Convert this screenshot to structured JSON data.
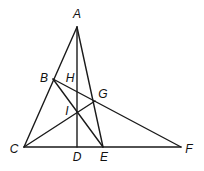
{
  "diagram": {
    "points": {
      "A": {
        "label": "A",
        "x": 77,
        "y": 27,
        "lx": 77,
        "ly": 15
      },
      "B": {
        "label": "B",
        "x": 53,
        "y": 79,
        "lx": 44,
        "ly": 79
      },
      "H": {
        "label": "H",
        "lx": 70,
        "ly": 79
      },
      "G": {
        "label": "G",
        "x": 95,
        "y": 101,
        "lx": 103,
        "ly": 95
      },
      "I": {
        "label": "I",
        "x": 78,
        "y": 112,
        "lx": 67,
        "ly": 112
      },
      "C": {
        "label": "C",
        "x": 24,
        "y": 147,
        "lx": 14,
        "ly": 150
      },
      "D": {
        "label": "D",
        "x": 77,
        "y": 147,
        "lx": 77,
        "ly": 158
      },
      "E": {
        "label": "E",
        "x": 103,
        "y": 147,
        "lx": 104,
        "ly": 158
      },
      "F": {
        "label": "F",
        "x": 181,
        "y": 147,
        "lx": 189,
        "ly": 150
      }
    },
    "segments": [
      "AC",
      "AD",
      "AE",
      "CF",
      "BF",
      "BE",
      "CG"
    ]
  }
}
